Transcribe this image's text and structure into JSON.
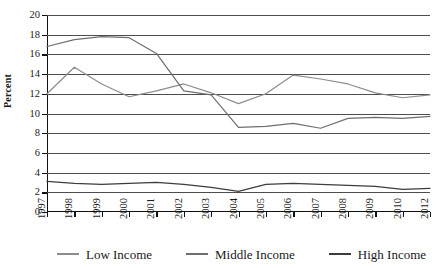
{
  "chart_data": {
    "type": "line",
    "title": "",
    "xlabel": "",
    "ylabel": "Percent",
    "ylim": [
      0,
      20
    ],
    "ytick_step": 2,
    "yticks": [
      0,
      2,
      4,
      6,
      8,
      10,
      12,
      14,
      16,
      18,
      20
    ],
    "grid": true,
    "legend_position": "bottom",
    "categories": [
      "1997",
      "1998",
      "1999",
      "2000",
      "2001",
      "2002",
      "2003",
      "2004",
      "2005",
      "2006",
      "2007",
      "2008",
      "2009",
      "2010",
      "2012"
    ],
    "series": [
      {
        "name": "Low Income",
        "color": "#8c8c8c",
        "values": [
          12.0,
          14.7,
          13.0,
          11.7,
          12.3,
          13.0,
          12.1,
          11.0,
          12.0,
          13.9,
          13.5,
          13.0,
          12.1,
          11.6,
          11.9
        ]
      },
      {
        "name": "Middle Income",
        "color": "#6e6e6e",
        "values": [
          16.8,
          17.5,
          17.8,
          17.7,
          16.1,
          12.3,
          11.9,
          8.6,
          8.7,
          9.0,
          8.5,
          9.5,
          9.6,
          9.5,
          9.7
        ]
      },
      {
        "name": "High Income",
        "color": "#3d3d3d",
        "values": [
          3.1,
          2.9,
          2.8,
          2.9,
          3.0,
          2.8,
          2.5,
          2.1,
          2.8,
          2.9,
          2.8,
          2.7,
          2.6,
          2.3,
          2.4
        ]
      }
    ],
    "legend": [
      {
        "label": "Low Income",
        "color": "#8c8c8c"
      },
      {
        "label": "Middle Income",
        "color": "#6e6e6e"
      },
      {
        "label": "High Income",
        "color": "#3d3d3d"
      }
    ]
  }
}
